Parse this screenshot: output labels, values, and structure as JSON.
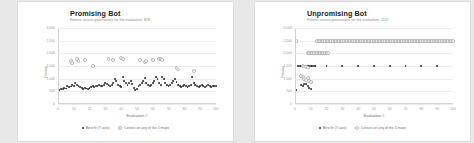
{
  "charts": [
    {
      "title": "Promising Bot",
      "subtitle": "Fitness across generations for the evaluation: 878",
      "xlabel": "Evaluation #",
      "ylabel": "Fitness",
      "legend": [
        {
          "label": "Best fit (Y axis)",
          "marker": "best"
        },
        {
          "label": "Losses on any of the 5 maps",
          "marker": "other"
        }
      ]
    },
    {
      "title": "Unpromising Bot",
      "subtitle": "Fitness across generations for the evaluation: 1157",
      "xlabel": "Evaluation #",
      "ylabel": "Fitness",
      "legend": [
        {
          "label": "Best fit (Y axis)",
          "marker": "best"
        },
        {
          "label": "Losses on any of the 5 maps",
          "marker": "other"
        }
      ]
    }
  ],
  "chart_data": [
    {
      "type": "scatter",
      "title": "Promising Bot",
      "subtitle": "Fitness across generations for the evaluation: 878",
      "xlabel": "Evaluation #",
      "ylabel": "Fitness",
      "xlim": [
        0,
        100
      ],
      "ylim": [
        0,
        3000
      ],
      "yticks": [
        0,
        500,
        1000,
        1500,
        2000,
        2500,
        3000
      ],
      "xticks": [
        0,
        10,
        20,
        30,
        40,
        50,
        60,
        70,
        80,
        90,
        100
      ],
      "grid": true,
      "legend_position": "bottom",
      "series": [
        {
          "name": "Best fit (Y axis)",
          "marker": "best",
          "points": [
            [
              1,
              560
            ],
            [
              2,
              600
            ],
            [
              3,
              580
            ],
            [
              4,
              640
            ],
            [
              5,
              610
            ],
            [
              6,
              700
            ],
            [
              7,
              660
            ],
            [
              8,
              690
            ],
            [
              9,
              740
            ],
            [
              10,
              700
            ],
            [
              11,
              820
            ],
            [
              12,
              760
            ],
            [
              13,
              700
            ],
            [
              14,
              660
            ],
            [
              15,
              620
            ],
            [
              16,
              600
            ],
            [
              17,
              640
            ],
            [
              18,
              610
            ],
            [
              19,
              590
            ],
            [
              20,
              620
            ],
            [
              21,
              660
            ],
            [
              22,
              700
            ],
            [
              23,
              680
            ],
            [
              24,
              720
            ],
            [
              25,
              700
            ],
            [
              26,
              760
            ],
            [
              27,
              720
            ],
            [
              28,
              700
            ],
            [
              29,
              760
            ],
            [
              30,
              820
            ],
            [
              31,
              780
            ],
            [
              32,
              740
            ],
            [
              33,
              700
            ],
            [
              34,
              760
            ],
            [
              35,
              820
            ],
            [
              36,
              1000
            ],
            [
              37,
              900
            ],
            [
              38,
              740
            ],
            [
              39,
              700
            ],
            [
              40,
              660
            ],
            [
              41,
              1080
            ],
            [
              42,
              900
            ],
            [
              43,
              820
            ],
            [
              44,
              760
            ],
            [
              45,
              820
            ],
            [
              46,
              900
            ],
            [
              47,
              780
            ],
            [
              48,
              620
            ],
            [
              49,
              560
            ],
            [
              50,
              600
            ],
            [
              51,
              700
            ],
            [
              52,
              760
            ],
            [
              53,
              820
            ],
            [
              54,
              900
            ],
            [
              55,
              1040
            ],
            [
              56,
              820
            ],
            [
              57,
              760
            ],
            [
              58,
              700
            ],
            [
              59,
              760
            ],
            [
              60,
              820
            ],
            [
              61,
              900
            ],
            [
              62,
              1060
            ],
            [
              63,
              980
            ],
            [
              64,
              820
            ],
            [
              65,
              760
            ],
            [
              66,
              1060
            ],
            [
              67,
              980
            ],
            [
              68,
              820
            ],
            [
              69,
              760
            ],
            [
              70,
              700
            ],
            [
              71,
              760
            ],
            [
              72,
              820
            ],
            [
              73,
              900
            ],
            [
              74,
              980
            ],
            [
              75,
              860
            ],
            [
              76,
              760
            ],
            [
              77,
              700
            ],
            [
              78,
              660
            ],
            [
              79,
              700
            ],
            [
              80,
              740
            ],
            [
              81,
              700
            ],
            [
              82,
              660
            ],
            [
              83,
              700
            ],
            [
              84,
              740
            ],
            [
              85,
              1060
            ],
            [
              86,
              820
            ],
            [
              87,
              740
            ],
            [
              88,
              700
            ],
            [
              89,
              660
            ],
            [
              90,
              700
            ],
            [
              91,
              740
            ],
            [
              92,
              700
            ],
            [
              93,
              680
            ],
            [
              94,
              700
            ],
            [
              95,
              740
            ],
            [
              96,
              700
            ],
            [
              97,
              680
            ],
            [
              98,
              700
            ],
            [
              99,
              720
            ],
            [
              100,
              700
            ]
          ]
        },
        {
          "name": "Losses on any of the 5 maps",
          "marker": "other",
          "points": [
            [
              8,
              1680
            ],
            [
              9,
              1620
            ],
            [
              12,
              1760
            ],
            [
              13,
              1700
            ],
            [
              17,
              1740
            ],
            [
              22,
              1500
            ],
            [
              32,
              1760
            ],
            [
              35,
              1720
            ],
            [
              40,
              1800
            ],
            [
              41,
              1760
            ],
            [
              52,
              1740
            ],
            [
              55,
              1640
            ],
            [
              56,
              1700
            ],
            [
              60,
              1720
            ],
            [
              64,
              1780
            ],
            [
              65,
              1760
            ],
            [
              66,
              1740
            ],
            [
              75,
              1420
            ],
            [
              76,
              1360
            ],
            [
              86,
              1300
            ]
          ]
        }
      ]
    },
    {
      "type": "scatter",
      "title": "Unpromising Bot",
      "subtitle": "Fitness across generations for the evaluation: 1157",
      "xlabel": "Evaluation #",
      "ylabel": "Fitness",
      "xlim": [
        0,
        100
      ],
      "ylim": [
        0,
        3000
      ],
      "yticks": [
        0,
        500,
        1000,
        1500,
        2000,
        2500,
        3000
      ],
      "xticks": [
        0,
        10,
        20,
        30,
        40,
        50,
        60,
        70,
        80,
        90,
        100
      ],
      "grid": true,
      "legend_position": "bottom",
      "series": [
        {
          "name": "Best fit (Y axis)",
          "marker": "best",
          "points": [
            [
              1,
              560
            ],
            [
              4,
              760
            ],
            [
              5,
              700
            ],
            [
              6,
              800
            ],
            [
              7,
              780
            ],
            [
              8,
              700
            ],
            [
              9,
              640
            ],
            [
              10,
              600
            ],
            [
              2,
              1500
            ],
            [
              3,
              1500
            ],
            [
              4,
              1500
            ],
            [
              5,
              1500
            ],
            [
              6,
              1500
            ],
            [
              7,
              1500
            ],
            [
              8,
              1500
            ],
            [
              9,
              1500
            ],
            [
              10,
              1500
            ],
            [
              11,
              1500
            ],
            [
              12,
              1500
            ],
            [
              13,
              1500
            ],
            [
              20,
              1500
            ],
            [
              30,
              1500
            ],
            [
              40,
              1500
            ],
            [
              50,
              1500
            ],
            [
              60,
              1500
            ],
            [
              70,
              1500
            ],
            [
              80,
              1500
            ],
            [
              90,
              1500
            ]
          ]
        },
        {
          "name": "Losses on any of the 5 maps",
          "marker": "other",
          "points": [
            [
              1,
              2500
            ],
            [
              14,
              2500
            ],
            [
              15,
              2500
            ],
            [
              16,
              2500
            ],
            [
              17,
              2500
            ],
            [
              18,
              2500
            ],
            [
              19,
              2500
            ],
            [
              20,
              2500
            ],
            [
              21,
              2500
            ],
            [
              22,
              2500
            ],
            [
              23,
              2500
            ],
            [
              24,
              2500
            ],
            [
              25,
              2500
            ],
            [
              26,
              2500
            ],
            [
              27,
              2500
            ],
            [
              28,
              2500
            ],
            [
              29,
              2500
            ],
            [
              30,
              2500
            ],
            [
              31,
              2500
            ],
            [
              32,
              2500
            ],
            [
              33,
              2500
            ],
            [
              34,
              2500
            ],
            [
              35,
              2500
            ],
            [
              36,
              2500
            ],
            [
              37,
              2500
            ],
            [
              38,
              2500
            ],
            [
              39,
              2500
            ],
            [
              40,
              2500
            ],
            [
              41,
              2500
            ],
            [
              42,
              2500
            ],
            [
              43,
              2500
            ],
            [
              44,
              2500
            ],
            [
              45,
              2500
            ],
            [
              46,
              2500
            ],
            [
              47,
              2500
            ],
            [
              48,
              2500
            ],
            [
              49,
              2500
            ],
            [
              50,
              2500
            ],
            [
              51,
              2500
            ],
            [
              52,
              2500
            ],
            [
              53,
              2500
            ],
            [
              54,
              2500
            ],
            [
              55,
              2500
            ],
            [
              56,
              2500
            ],
            [
              57,
              2500
            ],
            [
              58,
              2500
            ],
            [
              59,
              2500
            ],
            [
              60,
              2500
            ],
            [
              61,
              2500
            ],
            [
              62,
              2500
            ],
            [
              63,
              2500
            ],
            [
              64,
              2500
            ],
            [
              65,
              2500
            ],
            [
              66,
              2500
            ],
            [
              67,
              2500
            ],
            [
              68,
              2500
            ],
            [
              69,
              2500
            ],
            [
              70,
              2500
            ],
            [
              71,
              2500
            ],
            [
              72,
              2500
            ],
            [
              73,
              2500
            ],
            [
              74,
              2500
            ],
            [
              75,
              2500
            ],
            [
              76,
              2500
            ],
            [
              77,
              2500
            ],
            [
              78,
              2500
            ],
            [
              79,
              2500
            ],
            [
              80,
              2500
            ],
            [
              81,
              2500
            ],
            [
              82,
              2500
            ],
            [
              83,
              2500
            ],
            [
              84,
              2500
            ],
            [
              85,
              2500
            ],
            [
              86,
              2500
            ],
            [
              87,
              2500
            ],
            [
              88,
              2500
            ],
            [
              89,
              2500
            ],
            [
              90,
              2500
            ],
            [
              91,
              2500
            ],
            [
              92,
              2500
            ],
            [
              93,
              2500
            ],
            [
              94,
              2500
            ],
            [
              95,
              2500
            ],
            [
              96,
              2500
            ],
            [
              97,
              2500
            ],
            [
              98,
              2500
            ],
            [
              99,
              2500
            ],
            [
              100,
              2500
            ],
            [
              8,
              2000
            ],
            [
              9,
              2000
            ],
            [
              10,
              2000
            ],
            [
              11,
              2000
            ],
            [
              12,
              2000
            ],
            [
              13,
              2000
            ],
            [
              14,
              2000
            ],
            [
              15,
              2000
            ],
            [
              16,
              2000
            ],
            [
              17,
              2000
            ],
            [
              18,
              2000
            ],
            [
              19,
              2000
            ],
            [
              20,
              2000
            ],
            [
              21,
              2000
            ],
            [
              5,
              1500
            ],
            [
              6,
              1480
            ],
            [
              7,
              1460
            ],
            [
              8,
              1440
            ],
            [
              4,
              1100
            ],
            [
              5,
              1060
            ],
            [
              6,
              1000
            ],
            [
              7,
              960
            ],
            [
              8,
              1020
            ],
            [
              9,
              900
            ],
            [
              10,
              860
            ]
          ]
        }
      ]
    }
  ]
}
